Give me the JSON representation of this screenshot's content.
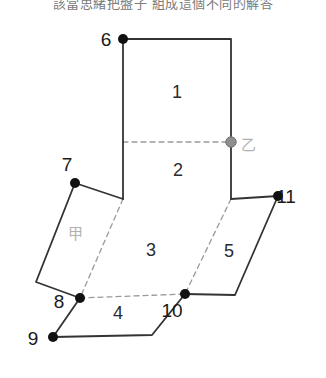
{
  "caption": {
    "text": "該當思緒把盤子 組成這個不同的解答"
  },
  "figure": {
    "width": 326,
    "height": 378,
    "stroke_color": "#333333",
    "dashed_color": "#9a9a9a",
    "vertex_color": "#111111",
    "marker_b_color": "#8f8f8f",
    "vertices": [
      {
        "id": "6",
        "x": 123,
        "y": 39,
        "label": "6",
        "lx": 106,
        "ly": 46,
        "marker": "solid"
      },
      {
        "id": "7",
        "x": 75,
        "y": 183,
        "label": "7",
        "lx": 67,
        "ly": 171,
        "marker": "solid"
      },
      {
        "id": "8",
        "x": 80,
        "y": 298,
        "label": "8",
        "lx": 59,
        "ly": 308,
        "marker": "solid"
      },
      {
        "id": "9",
        "x": 53,
        "y": 337,
        "label": "9",
        "lx": 33,
        "ly": 345,
        "marker": "solid"
      },
      {
        "id": "10",
        "x": 185,
        "y": 294,
        "label": "10",
        "lx": 172,
        "ly": 317,
        "marker": "solid"
      },
      {
        "id": "11",
        "x": 278,
        "y": 196,
        "label": "11",
        "lx": 286,
        "ly": 203,
        "marker": "solid"
      },
      {
        "id": "yi",
        "x": 231,
        "y": 142,
        "label": "乙",
        "lx": 241,
        "ly": 150,
        "marker": "gray"
      }
    ],
    "regions": [
      {
        "id": "1",
        "label": "1",
        "x": 177,
        "y": 98
      },
      {
        "id": "2",
        "label": "2",
        "x": 178,
        "y": 176
      },
      {
        "id": "3",
        "label": "3",
        "x": 151,
        "y": 256
      },
      {
        "id": "4",
        "label": "4",
        "x": 118,
        "y": 319
      },
      {
        "id": "5",
        "label": "5",
        "x": 229,
        "y": 257
      },
      {
        "id": "jia",
        "label": "甲",
        "x": 75,
        "y": 239
      }
    ],
    "solid_paths": [
      "M123,39 L231,39 L231,199",
      "M123,39 L123,199",
      "M75,183 L123,199",
      "M231,199 L278,196",
      "M75,183 L36,282 L80,298",
      "M278,196 L235,295 L185,294",
      "M80,298 L53,337 L152,335 L185,294"
    ],
    "dashed_paths": [
      "M123,142 L231,142",
      "M123,199 L80,298",
      "M231,199 L185,294",
      "M80,298 L185,294"
    ]
  }
}
